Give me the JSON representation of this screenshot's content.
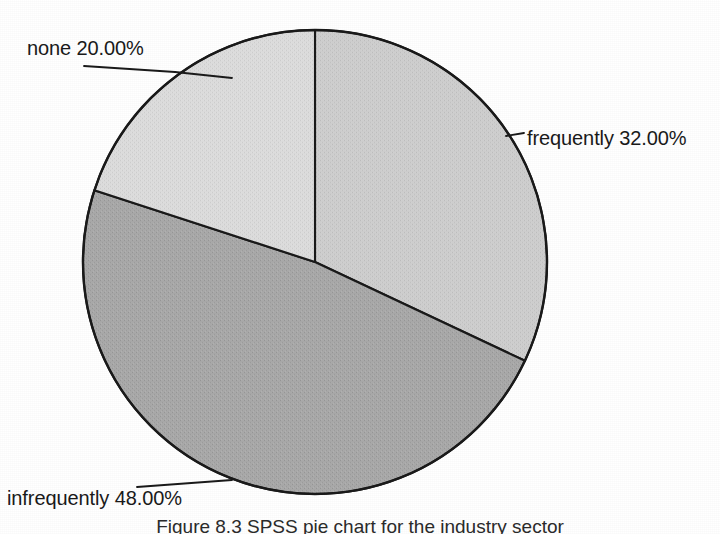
{
  "chart_data": {
    "type": "pie",
    "title": "",
    "xlabel": "",
    "ylabel": "",
    "legend_position": "none",
    "grid": false,
    "categories": [
      "frequently",
      "infrequently",
      "none"
    ],
    "values": [
      32.0,
      48.0,
      20.0
    ],
    "value_suffix": "%",
    "slices": [
      {
        "name": "frequently",
        "value": 32.0,
        "label": "frequently 32.00%",
        "percent_text": "32.00%",
        "color": "#cfcfcf",
        "start_angle_deg": 0,
        "end_angle_deg": 115.2,
        "leader_side": "right"
      },
      {
        "name": "infrequently",
        "value": 48.0,
        "label": "infrequently 48.00%",
        "percent_text": "48.00%",
        "color": "#a8a8a8",
        "start_angle_deg": 115.2,
        "end_angle_deg": 288.0,
        "leader_side": "bottom-left"
      },
      {
        "name": "none",
        "value": 20.0,
        "label": "none 20.00%",
        "percent_text": "20.00%",
        "color": "#dcdcdc",
        "start_angle_deg": 288.0,
        "end_angle_deg": 360.0,
        "leader_side": "top-left"
      }
    ],
    "outline_color": "#1a1a1a",
    "background_color": "#ffffff"
  },
  "labels": {
    "none": "none 20.00%",
    "frequently": "frequently 32.00%",
    "infrequently": "infrequently 48.00%"
  },
  "caption": {
    "text": "Figure 8.3 SPSS pie chart for the industry sector"
  }
}
